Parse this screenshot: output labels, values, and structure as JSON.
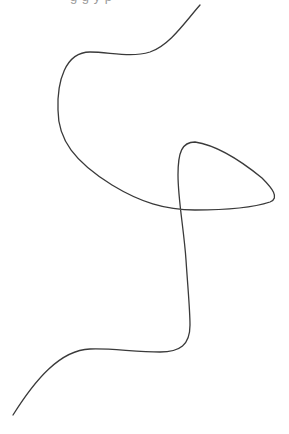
{
  "canvas": {
    "width": 289,
    "height": 434,
    "background": "#ffffff"
  },
  "cutoff_text": "g           g y p",
  "stroke": {
    "color": "#3a3a3a",
    "width": 1.3
  },
  "curve": {
    "description": "single continuous freehand curve with one self-intersection loop",
    "path": "M 200 5 C 185 22, 170 45, 150 52 C 130 58, 110 52, 90 52 C 65 52, 57 82, 58 110 C 58 140, 75 162, 112 185 C 140 202, 165 210, 195 210 C 225 210, 255 207, 270 202 C 280 198, 272 188, 262 178 C 240 160, 215 145, 195 142 C 182 142, 178 152, 178 175 C 178 200, 184 230, 186 260 C 188 290, 190 310, 190 325 C 190 345, 180 352, 160 352 C 135 352, 110 348, 90 349 C 60 350, 35 380, 13 415",
    "start": [
      200,
      5
    ],
    "end": [
      13,
      415
    ],
    "self_intersection": [
      182,
      210
    ],
    "loop_tip": [
      276,
      197
    ]
  }
}
